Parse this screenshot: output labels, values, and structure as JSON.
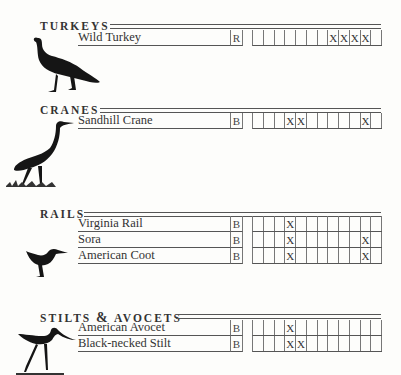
{
  "document": {
    "type": "bird checklist",
    "sections": [
      {
        "title": "TURKEYS",
        "icon": "turkey-silhouette-icon",
        "species": [
          {
            "name": "Wild Turkey",
            "status": "R",
            "months": [
              "",
              "",
              "",
              "",
              "",
              "",
              "",
              "X",
              "X",
              "X",
              "X",
              ""
            ]
          }
        ]
      },
      {
        "title": "CRANES",
        "icon": "crane-silhouette-icon",
        "species": [
          {
            "name": "Sandhill Crane",
            "status": "B",
            "months": [
              "",
              "",
              "",
              "X",
              "X",
              "",
              "",
              "",
              "",
              "",
              "X",
              ""
            ]
          }
        ]
      },
      {
        "title": "RAILS",
        "icon": "rail-silhouette-icon",
        "species": [
          {
            "name": "Virginia Rail",
            "status": "B",
            "months": [
              "",
              "",
              "",
              "X",
              "",
              "",
              "",
              "",
              "",
              "",
              "",
              ""
            ]
          },
          {
            "name": "Sora",
            "status": "B",
            "months": [
              "",
              "",
              "",
              "X",
              "",
              "",
              "",
              "",
              "",
              "",
              "X",
              ""
            ]
          },
          {
            "name": "American Coot",
            "status": "B",
            "months": [
              "",
              "",
              "",
              "X",
              "",
              "",
              "",
              "",
              "",
              "",
              "X",
              ""
            ]
          }
        ]
      },
      {
        "title_part1": "STILTS",
        "title_amp": "&",
        "title_part2": "AVOCETS",
        "icon": "stilt-silhouette-icon",
        "species": [
          {
            "name": "American Avocet",
            "status": "B",
            "months": [
              "",
              "",
              "",
              "X",
              "",
              "",
              "",
              "",
              "",
              "",
              "",
              ""
            ]
          },
          {
            "name": "Black-necked Stilt",
            "status": "B",
            "months": [
              "",
              "",
              "",
              "X",
              "X",
              "",
              "",
              "",
              "",
              "",
              "",
              ""
            ]
          }
        ]
      }
    ]
  }
}
